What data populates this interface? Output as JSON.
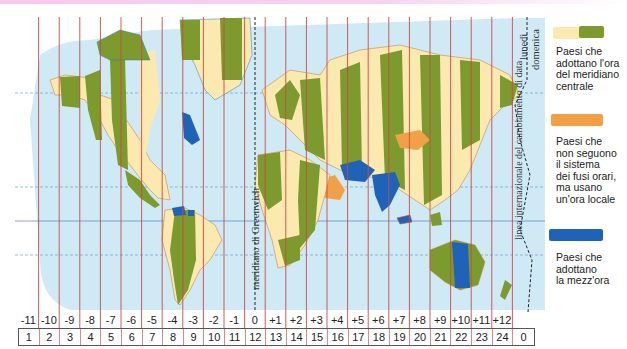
{
  "map": {
    "title": "Fusi orari del mondo",
    "colors": {
      "ocean": "#cfeaf5",
      "land_light": "#fbe9b0",
      "land_green": "#7c9a2e",
      "no_timezone_orange": "#f2a047",
      "half_hour_blue": "#1f63b8",
      "zone_line": "#c94a45",
      "top_band": "#f3c8ee"
    },
    "vertical_labels": {
      "greenwich": "meridiano di Greenwich",
      "date_line": "linea internazionale del cambiamento di data",
      "monday": "lunedì",
      "sunday": "domenica"
    }
  },
  "timezones": {
    "offsets": [
      "-11",
      "-10",
      "-9",
      "-8",
      "-7",
      "-6",
      "-5",
      "-4",
      "-3",
      "-2",
      "-1",
      "0",
      "+1",
      "+2",
      "+3",
      "+4",
      "+5",
      "+6",
      "+7",
      "+8",
      "+9",
      "+10",
      "+11",
      "+12",
      ""
    ],
    "hours": [
      "1",
      "2",
      "3",
      "4",
      "5",
      "6",
      "7",
      "8",
      "9",
      "10",
      "11",
      "12",
      "13",
      "14",
      "15",
      "16",
      "17",
      "18",
      "19",
      "20",
      "21",
      "22",
      "23",
      "24",
      "0"
    ]
  },
  "legend": {
    "items": [
      {
        "label_lines": [
          "Paesi che",
          "adottano l'ora",
          "del meridiano",
          "centrale"
        ],
        "colors": [
          "#fbe9b0",
          "#7c9a2e"
        ]
      },
      {
        "label_lines": [
          "Paesi che",
          "non seguono",
          "il sistema",
          "dei fusi orari,",
          "ma usano",
          "un'ora locale"
        ],
        "colors": [
          "#f2a047"
        ]
      },
      {
        "label_lines": [
          "Paesi che",
          "adottano",
          "la mezz'ora"
        ],
        "colors": [
          "#1f63b8"
        ]
      }
    ]
  }
}
